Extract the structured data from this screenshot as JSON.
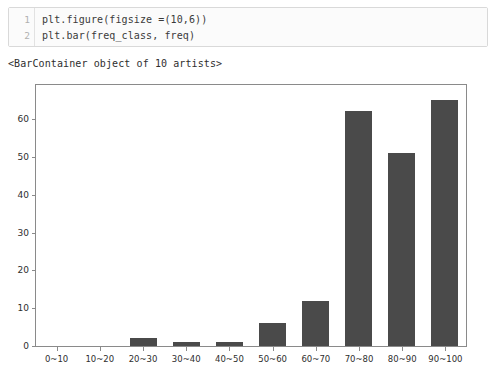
{
  "notebook": {
    "code_cell": {
      "line_numbers": [
        "1",
        "2"
      ],
      "lines": [
        "plt.figure(figsize =(10,6))",
        "plt.bar(freq_class, freq)"
      ]
    },
    "text_output": "<BarContainer object of 10 artists>"
  },
  "chart_data": {
    "type": "bar",
    "title": "",
    "xlabel": "",
    "ylabel": "",
    "categories": [
      "0~10",
      "10~20",
      "20~30",
      "30~40",
      "40~50",
      "50~60",
      "60~70",
      "70~80",
      "80~90",
      "90~100"
    ],
    "values": [
      0,
      0,
      2,
      1,
      1,
      6,
      12,
      62,
      51,
      65
    ],
    "ylim": [
      0,
      69
    ],
    "yticks": [
      0,
      10,
      20,
      30,
      40,
      50,
      60
    ],
    "ytick_labels": [
      "0",
      "10",
      "20",
      "30",
      "40",
      "50",
      "60"
    ],
    "grid": false,
    "legend": false,
    "bar_color": "#4a4a4a",
    "frame_color": "#8a8a8a",
    "background": "#ffffff"
  }
}
